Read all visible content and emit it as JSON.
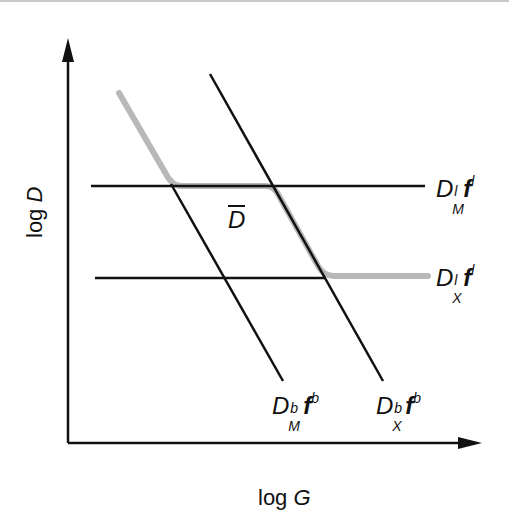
{
  "diagram": {
    "x_axis_label": {
      "prefix": "log ",
      "var": "G"
    },
    "y_axis_label": {
      "prefix": "log ",
      "var": "D"
    },
    "curve_label": "D",
    "colors": {
      "lines": "#111111",
      "curve": "#b8b8b8",
      "background": "#ffffff"
    },
    "lines": [
      {
        "id": "DMl_fl",
        "label": {
          "base": "D",
          "sup": "l",
          "sub": "M",
          "f": "f",
          "fsup": "l"
        },
        "orientation": "horizontal"
      },
      {
        "id": "DXl_fl",
        "label": {
          "base": "D",
          "sup": "l",
          "sub": "X",
          "f": "f",
          "fsup": "l"
        },
        "orientation": "horizontal"
      },
      {
        "id": "DMb_fb",
        "label": {
          "base": "D",
          "sup": "b",
          "sub": "M",
          "f": "f",
          "fsup": "b"
        },
        "orientation": "diagonal"
      },
      {
        "id": "DXb_fb",
        "label": {
          "base": "D",
          "sup": "b",
          "sub": "X",
          "f": "f",
          "fsup": "b"
        },
        "orientation": "diagonal"
      }
    ]
  }
}
